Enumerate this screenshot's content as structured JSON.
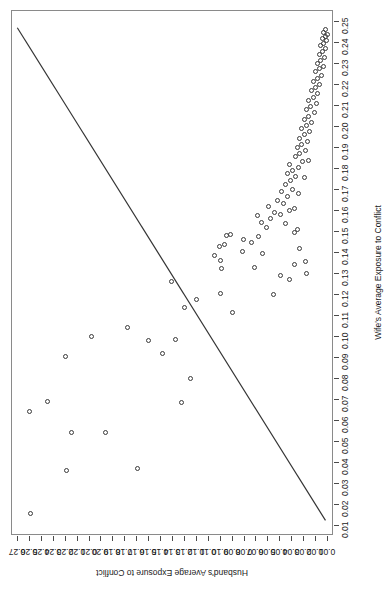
{
  "chart_data": {
    "type": "scatter",
    "title": "",
    "subtitle": "",
    "xlabel": "Wife's Average Exposure to Conflict",
    "ylabel": "Husband's Average Exposure to Conflict",
    "xlim": [
      0.005,
      0.255
    ],
    "ylim": [
      0.005,
      0.275
    ],
    "xticks": [
      "0.01",
      "0.02",
      "0.03",
      "0.04",
      "0.05",
      "0.06",
      "0.07",
      "0.08",
      "0.09",
      "0.10",
      "0.11",
      "0.12",
      "0.13",
      "0.14",
      "0.15",
      "0.16",
      "0.17",
      "0.18",
      "0.19",
      "0.20",
      "0.21",
      "0.22",
      "0.23",
      "0.24",
      "0.25"
    ],
    "yticks": [
      "0.01",
      "0.02",
      "0.03",
      "0.04",
      "0.05",
      "0.06",
      "0.07",
      "0.08",
      "0.09",
      "0.10",
      "0.11",
      "0.12",
      "0.13",
      "0.14",
      "0.15",
      "0.16",
      "0.17",
      "0.18",
      "0.19",
      "0.20",
      "0.21",
      "0.22",
      "0.23",
      "0.24",
      "0.25",
      "0.26",
      "0.27"
    ],
    "xtick_values": [
      0.01,
      0.02,
      0.03,
      0.04,
      0.05,
      0.06,
      0.07,
      0.08,
      0.09,
      0.1,
      0.11,
      0.12,
      0.13,
      0.14,
      0.15,
      0.16,
      0.17,
      0.18,
      0.19,
      0.2,
      0.21,
      0.22,
      0.23,
      0.24,
      0.25
    ],
    "ytick_values": [
      0.01,
      0.02,
      0.03,
      0.04,
      0.05,
      0.06,
      0.07,
      0.08,
      0.09,
      0.1,
      0.11,
      0.12,
      0.13,
      0.14,
      0.15,
      0.16,
      0.17,
      0.18,
      0.19,
      0.2,
      0.21,
      0.22,
      0.23,
      0.24,
      0.25,
      0.26,
      0.27
    ],
    "grid": false,
    "legend": null,
    "orientation_note": "figure rotated 180 degrees; x-axis labels run vertically along right edge, y-axis labels inverted along bottom edge",
    "marker": {
      "shape": "open-circle",
      "size_px": 5,
      "color": "#3a3a3a",
      "fill": "none"
    },
    "fit_line": {
      "type": "linear",
      "color": "#333333",
      "width_px": 1.2,
      "p1": {
        "x": 0.0115,
        "y": 0.0105
      },
      "p2": {
        "x": 0.247,
        "y": 0.2705
      }
    },
    "points": [
      {
        "x": 0.0155,
        "y": 0.2595
      },
      {
        "x": 0.036,
        "y": 0.229
      },
      {
        "x": 0.0645,
        "y": 0.26
      },
      {
        "x": 0.0905,
        "y": 0.23
      },
      {
        "x": 0.0545,
        "y": 0.197
      },
      {
        "x": 0.037,
        "y": 0.17
      },
      {
        "x": 0.0545,
        "y": 0.225
      },
      {
        "x": 0.069,
        "y": 0.2455
      },
      {
        "x": 0.0685,
        "y": 0.1325
      },
      {
        "x": 0.08,
        "y": 0.125
      },
      {
        "x": 0.0985,
        "y": 0.1375
      },
      {
        "x": 0.098,
        "y": 0.1605
      },
      {
        "x": 0.092,
        "y": 0.149
      },
      {
        "x": 0.1,
        "y": 0.2085
      },
      {
        "x": 0.1045,
        "y": 0.178
      },
      {
        "x": 0.1175,
        "y": 0.1205
      },
      {
        "x": 0.1205,
        "y": 0.1
      },
      {
        "x": 0.1115,
        "y": 0.09
      },
      {
        "x": 0.114,
        "y": 0.13
      },
      {
        "x": 0.126,
        "y": 0.141
      },
      {
        "x": 0.136,
        "y": 0.1005
      },
      {
        "x": 0.1385,
        "y": 0.105
      },
      {
        "x": 0.143,
        "y": 0.101
      },
      {
        "x": 0.144,
        "y": 0.0965
      },
      {
        "x": 0.148,
        "y": 0.0955
      },
      {
        "x": 0.1485,
        "y": 0.0915
      },
      {
        "x": 0.1325,
        "y": 0.0995
      },
      {
        "x": 0.12,
        "y": 0.056
      },
      {
        "x": 0.129,
        "y": 0.05
      },
      {
        "x": 0.133,
        "y": 0.072
      },
      {
        "x": 0.1395,
        "y": 0.065
      },
      {
        "x": 0.1405,
        "y": 0.082
      },
      {
        "x": 0.145,
        "y": 0.074
      },
      {
        "x": 0.1475,
        "y": 0.068
      },
      {
        "x": 0.146,
        "y": 0.0805
      },
      {
        "x": 0.152,
        "y": 0.062
      },
      {
        "x": 0.1545,
        "y": 0.0655
      },
      {
        "x": 0.156,
        "y": 0.0585
      },
      {
        "x": 0.1575,
        "y": 0.069
      },
      {
        "x": 0.159,
        "y": 0.0545
      },
      {
        "x": 0.162,
        "y": 0.06
      },
      {
        "x": 0.154,
        "y": 0.046
      },
      {
        "x": 0.158,
        "y": 0.0495
      },
      {
        "x": 0.16,
        "y": 0.0425
      },
      {
        "x": 0.1635,
        "y": 0.047
      },
      {
        "x": 0.165,
        "y": 0.052
      },
      {
        "x": 0.1665,
        "y": 0.044
      },
      {
        "x": 0.169,
        "y": 0.049
      },
      {
        "x": 0.17,
        "y": 0.04
      },
      {
        "x": 0.1725,
        "y": 0.0455
      },
      {
        "x": 0.1745,
        "y": 0.0415
      },
      {
        "x": 0.176,
        "y": 0.037
      },
      {
        "x": 0.1775,
        "y": 0.044
      },
      {
        "x": 0.179,
        "y": 0.0395
      },
      {
        "x": 0.1805,
        "y": 0.035
      },
      {
        "x": 0.182,
        "y": 0.042
      },
      {
        "x": 0.1835,
        "y": 0.031
      },
      {
        "x": 0.1855,
        "y": 0.0375
      },
      {
        "x": 0.187,
        "y": 0.034
      },
      {
        "x": 0.1885,
        "y": 0.029
      },
      {
        "x": 0.19,
        "y": 0.036
      },
      {
        "x": 0.1915,
        "y": 0.0325
      },
      {
        "x": 0.193,
        "y": 0.0275
      },
      {
        "x": 0.1945,
        "y": 0.034
      },
      {
        "x": 0.196,
        "y": 0.03
      },
      {
        "x": 0.1975,
        "y": 0.0255
      },
      {
        "x": 0.199,
        "y": 0.032
      },
      {
        "x": 0.2005,
        "y": 0.028
      },
      {
        "x": 0.202,
        "y": 0.0235
      },
      {
        "x": 0.2035,
        "y": 0.03
      },
      {
        "x": 0.205,
        "y": 0.0265
      },
      {
        "x": 0.2065,
        "y": 0.0215
      },
      {
        "x": 0.208,
        "y": 0.028
      },
      {
        "x": 0.2095,
        "y": 0.0245
      },
      {
        "x": 0.211,
        "y": 0.02
      },
      {
        "x": 0.2125,
        "y": 0.026
      },
      {
        "x": 0.214,
        "y": 0.0225
      },
      {
        "x": 0.2155,
        "y": 0.0185
      },
      {
        "x": 0.217,
        "y": 0.024
      },
      {
        "x": 0.2185,
        "y": 0.0205
      },
      {
        "x": 0.22,
        "y": 0.017
      },
      {
        "x": 0.2215,
        "y": 0.022
      },
      {
        "x": 0.223,
        "y": 0.019
      },
      {
        "x": 0.2245,
        "y": 0.0155
      },
      {
        "x": 0.226,
        "y": 0.0205
      },
      {
        "x": 0.2275,
        "y": 0.0175
      },
      {
        "x": 0.2285,
        "y": 0.014
      },
      {
        "x": 0.23,
        "y": 0.019
      },
      {
        "x": 0.2315,
        "y": 0.016
      },
      {
        "x": 0.233,
        "y": 0.013
      },
      {
        "x": 0.2345,
        "y": 0.0175
      },
      {
        "x": 0.2355,
        "y": 0.0145
      },
      {
        "x": 0.237,
        "y": 0.012
      },
      {
        "x": 0.2385,
        "y": 0.016
      },
      {
        "x": 0.2395,
        "y": 0.0135
      },
      {
        "x": 0.241,
        "y": 0.011
      },
      {
        "x": 0.242,
        "y": 0.015
      },
      {
        "x": 0.243,
        "y": 0.0125
      },
      {
        "x": 0.244,
        "y": 0.0105
      },
      {
        "x": 0.245,
        "y": 0.014
      },
      {
        "x": 0.246,
        "y": 0.0118
      },
      {
        "x": 0.13,
        "y": 0.028
      },
      {
        "x": 0.1355,
        "y": 0.0285
      },
      {
        "x": 0.142,
        "y": 0.034
      },
      {
        "x": 0.1495,
        "y": 0.0385
      },
      {
        "x": 0.151,
        "y": 0.0355
      },
      {
        "x": 0.161,
        "y": 0.0385
      },
      {
        "x": 0.168,
        "y": 0.0345
      },
      {
        "x": 0.1755,
        "y": 0.03
      },
      {
        "x": 0.184,
        "y": 0.0265
      },
      {
        "x": 0.1345,
        "y": 0.0385
      },
      {
        "x": 0.127,
        "y": 0.042
      }
    ]
  }
}
